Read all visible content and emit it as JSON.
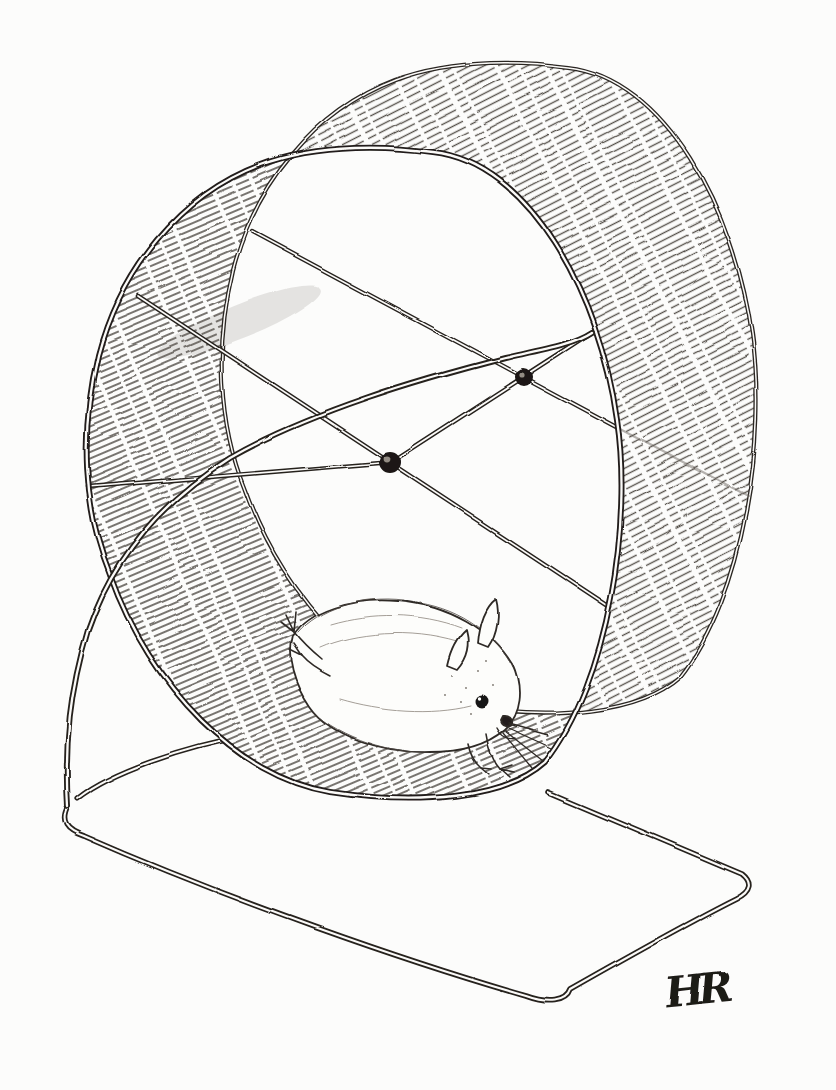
{
  "artwork": {
    "type": "pen-and-ink sketch",
    "subject": "hamster running inside an exercise wheel on a wire stand with a rectangular wire base",
    "signature": "HR",
    "paper_color": "#fcfcfb",
    "ink_color": "#26221e",
    "hatch_color": "#57524c",
    "elements": {
      "wheel": "cylindrical running wheel drawn in three-quarter view with hatched tread band",
      "spokes": "two crossing spoke rods on the open front face and one diameter rod on the back face",
      "stand": "curved wire arm from the axle down to a rounded rectangular floor base",
      "hamster": "small hamster stretched out running, dark round eye, upright ears, whiskers, splayed hind feet"
    }
  }
}
